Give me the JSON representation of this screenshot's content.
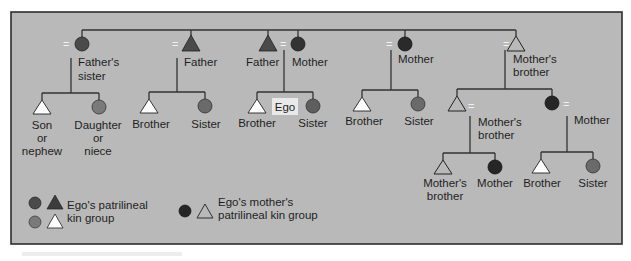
{
  "colors": {
    "panel_bg": "#b9b9b9",
    "panel_border": "#2e2e2e",
    "patrilineal_dark": "#4a4a4a",
    "patrilineal_medium": "#7a7a7a",
    "mothers_patrilineal_dark": "#262626",
    "open_triangle_fill": "#b9b9b9",
    "ego_triangle_fill": "#ffffff",
    "line": "#333333"
  },
  "marriage_symbol": "=",
  "generation1": {
    "fathers_sister": [
      "Father's",
      "sister"
    ],
    "father_left": "Father",
    "father_ego": "Father",
    "mother_ego": "Mother",
    "mother_right": "Mother",
    "mothers_brother": [
      "Mother's",
      "brother"
    ]
  },
  "generation2": {
    "fs_son": [
      "Son",
      "or",
      "nephew"
    ],
    "fs_daughter": [
      "Daughter",
      "or",
      "niece"
    ],
    "f_brother": "Brother",
    "f_sister": "Sister",
    "ego_brother": "Brother",
    "ego_label": "Ego",
    "ego_sister": "Sister",
    "m_brother": "Brother",
    "m_sister": "Sister",
    "mb_son": [
      "Mother's",
      "brother"
    ],
    "mb_daughter": "Mother"
  },
  "generation3": {
    "mbs_son": [
      "Mother's",
      "brother"
    ],
    "mbs_daughter": "Mother",
    "mbd_son": "Brother",
    "mbd_daughter": "Sister"
  },
  "legend": {
    "patrilineal": [
      "Ego's patrilineal",
      "kin group"
    ],
    "mothers_patrilineal": [
      "Ego's mother's",
      "patrilineal kin group"
    ]
  }
}
